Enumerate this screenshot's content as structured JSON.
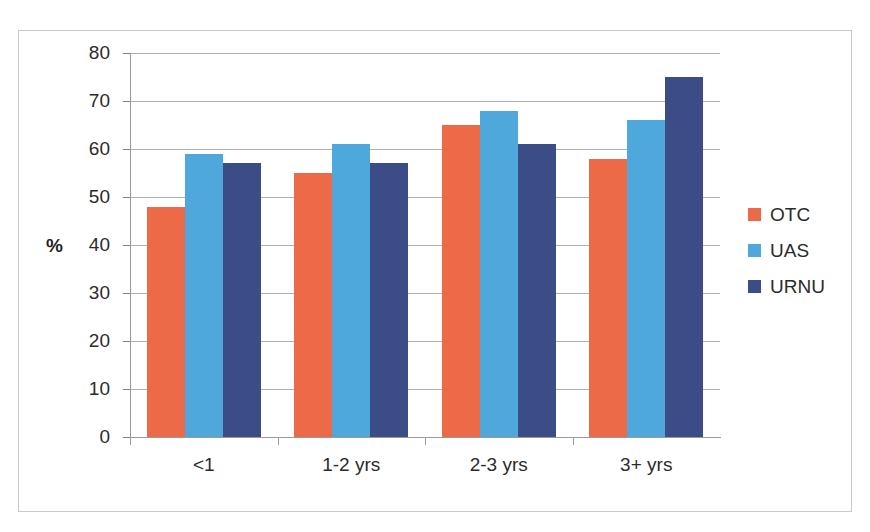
{
  "chart_data": {
    "type": "bar",
    "title": "",
    "subtitle": "",
    "xlabel": "",
    "ylabel": "%",
    "ylim": [
      0,
      80
    ],
    "ytick_step": 10,
    "yticks": [
      80,
      70,
      60,
      50,
      40,
      30,
      20,
      10,
      0
    ],
    "grid": true,
    "legend_position": "right",
    "categories": [
      "<1",
      "1-2 yrs",
      "2-3 yrs",
      "3+ yrs"
    ],
    "series": [
      {
        "name": "OTC",
        "color": "#ED6A48",
        "values": [
          48,
          55,
          65,
          58
        ]
      },
      {
        "name": "UAS",
        "color": "#4FA8DC",
        "values": [
          59,
          61,
          68,
          66
        ]
      },
      {
        "name": "URNU",
        "color": "#3B4C87",
        "values": [
          57,
          57,
          61,
          75
        ]
      }
    ]
  },
  "legend": {
    "items": [
      {
        "label": "OTC",
        "color": "#ED6A48"
      },
      {
        "label": "UAS",
        "color": "#4FA8DC"
      },
      {
        "label": "URNU",
        "color": "#3B4C87"
      }
    ]
  },
  "colors": {
    "otc": "#ED6A48",
    "uas": "#4FA8DC",
    "urnu": "#3B4C87",
    "gridline": "#b0b0b0",
    "axis": "#9a9a9a",
    "frame_border": "#c9c9c9",
    "text": "#2b2b2b",
    "background": "#ffffff"
  }
}
